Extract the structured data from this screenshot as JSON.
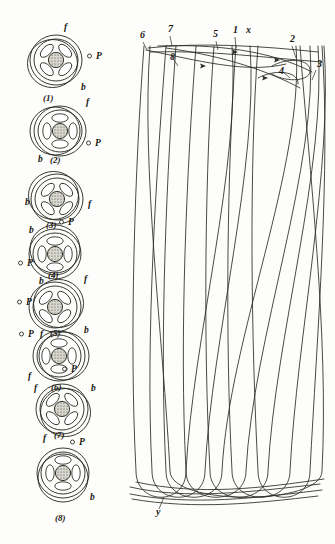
{
  "plate": {
    "title": "Rotation of cell and strand braid diagram",
    "background_color": "#fdfdfb",
    "ink_color": "#24241c"
  },
  "cells": {
    "label_f": "f",
    "label_b": "b",
    "label_p": "P",
    "items": [
      {
        "number": "(1)",
        "cx": 56,
        "cy": 60,
        "rot": 0,
        "f": {
          "x": 64,
          "y": 30
        },
        "b": {
          "x": 81,
          "y": 90
        },
        "p": {
          "x": 96,
          "y": 59
        },
        "num": {
          "x": 43,
          "y": 101
        }
      },
      {
        "number": "(2)",
        "cx": 60,
        "cy": 131,
        "rot": 45,
        "f": {
          "x": 86,
          "y": 105
        },
        "b": {
          "x": 38,
          "y": 162
        },
        "p": {
          "x": 95,
          "y": 146
        },
        "num": {
          "x": 50,
          "y": 163
        }
      },
      {
        "number": "(3)",
        "cx": 57,
        "cy": 199,
        "rot": 90,
        "f": {
          "x": 88,
          "y": 207
        },
        "b": {
          "x": 25,
          "y": 205
        },
        "p": {
          "x": 68,
          "y": 225
        },
        "num": {
          "x": 46,
          "y": 228
        }
      },
      {
        "number": "(4)",
        "cx": 55,
        "cy": 254,
        "rot": 135,
        "f": {
          "x": 84,
          "y": 282
        },
        "b": {
          "x": 29,
          "y": 233
        },
        "p": {
          "x": 27,
          "y": 266
        },
        "num": {
          "x": 48,
          "y": 278
        }
      },
      {
        "number": "(5)",
        "cx": 55,
        "cy": 307,
        "rot": 180,
        "f": {
          "x": 40,
          "y": 337
        },
        "b": {
          "x": 39,
          "y": 284
        },
        "p": {
          "x": 26,
          "y": 305
        },
        "num": {
          "x": 50,
          "y": 336
        }
      },
      {
        "number": "(6)",
        "cx": 59,
        "cy": 356,
        "rot": 225,
        "f": {
          "x": 28,
          "y": 379
        },
        "b": {
          "x": 84,
          "y": 333
        },
        "p": {
          "x": 28,
          "y": 337
        },
        "num": {
          "x": 51,
          "y": 390
        }
      },
      {
        "number": "(7)",
        "cx": 62,
        "cy": 409,
        "rot": 270,
        "f": {
          "x": 34,
          "y": 391
        },
        "b": {
          "x": 91,
          "y": 391
        },
        "p": {
          "x": 71,
          "y": 372
        },
        "num": {
          "x": 54,
          "y": 438
        }
      },
      {
        "number": "(8)",
        "cx": 63,
        "cy": 473,
        "rot": 315,
        "f": {
          "x": 43,
          "y": 441
        },
        "b": {
          "x": 90,
          "y": 500
        },
        "p": {
          "x": 79,
          "y": 445
        },
        "num": {
          "x": 55,
          "y": 521
        }
      }
    ]
  },
  "braid": {
    "top_labels": [
      {
        "text": "6",
        "x": 140,
        "y": 38
      },
      {
        "text": "7",
        "x": 168,
        "y": 32
      },
      {
        "text": "8",
        "x": 170,
        "y": 60
      },
      {
        "text": "5",
        "x": 213,
        "y": 37
      },
      {
        "text": "1",
        "x": 233,
        "y": 33
      },
      {
        "text": "x",
        "x": 246,
        "y": 33
      },
      {
        "text": "2",
        "x": 290,
        "y": 42
      },
      {
        "text": "3",
        "x": 317,
        "y": 67
      },
      {
        "text": "4",
        "x": 279,
        "y": 74
      }
    ],
    "bottom_labels": [
      {
        "text": "y",
        "x": 156,
        "y": 515
      }
    ]
  }
}
